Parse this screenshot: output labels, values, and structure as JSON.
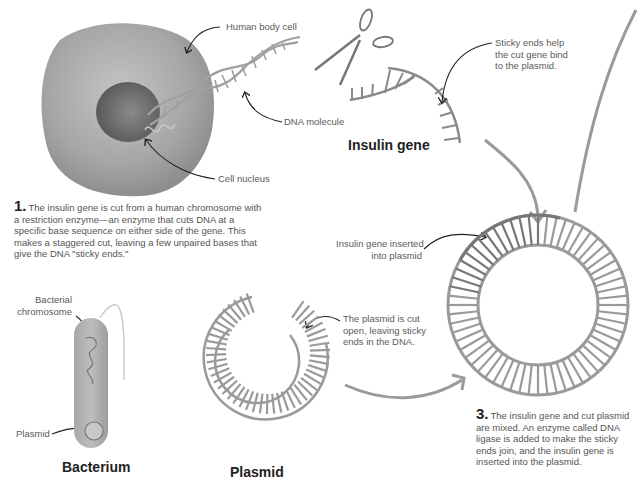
{
  "labels": {
    "human_body_cell": "Human body cell",
    "dna_molecule": "DNA molecule",
    "cell_nucleus": "Cell nucleus",
    "sticky_ends_help": [
      "Sticky ends help",
      "the cut gene bind",
      "to the plasmid."
    ],
    "insulin_gene_inserted": [
      "Insulin gene inserted",
      "into plasmid"
    ],
    "bacterial_chromosome": [
      "Bacterial",
      "chromosome"
    ],
    "plasmid_in_bacterium": "Plasmid",
    "plasmid_cut_open": [
      "The plasmid is cut",
      "open, leaving sticky",
      "ends in the DNA."
    ]
  },
  "titles": {
    "insulin_gene": "Insulin gene",
    "bacterium": "Bacterium",
    "plasmid": "Plasmid"
  },
  "steps": [
    {
      "number": "1.",
      "text": "The insulin gene is cut from a human chromosome with a restriction enzyme—an enzyme that cuts DNA at a specific base sequence on either side of the gene. This makes a staggered cut, leaving a few unpaired bases that give the DNA \"sticky ends.\""
    },
    {
      "number": "3.",
      "text": "The insulin gene and cut plasmid are mixed. An enzyme called DNA ligase is added to make the sticky ends join, and the insulin gene is inserted into the plasmid."
    }
  ],
  "colors": {
    "strand": "#9a9a9a",
    "strand_dark": "#777777",
    "cell": "#a8a8a8",
    "nucleus": "#6e6e6e",
    "text": "#555555",
    "title": "#222222"
  }
}
